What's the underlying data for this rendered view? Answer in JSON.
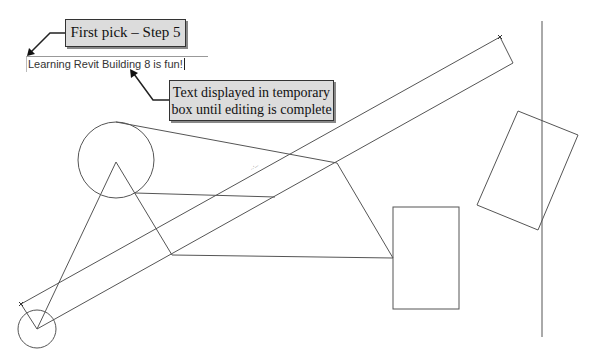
{
  "callouts": {
    "first_pick": "First pick – Step 5",
    "temp_box_line1": "Text displayed in temporary",
    "temp_box_line2": "box until editing is complete"
  },
  "text_editor": {
    "value": "Learning Revit Building 8 is fun!"
  },
  "colors": {
    "callout_fill": "#dcdcdc",
    "line": "#555555",
    "background": "#ffffff"
  }
}
